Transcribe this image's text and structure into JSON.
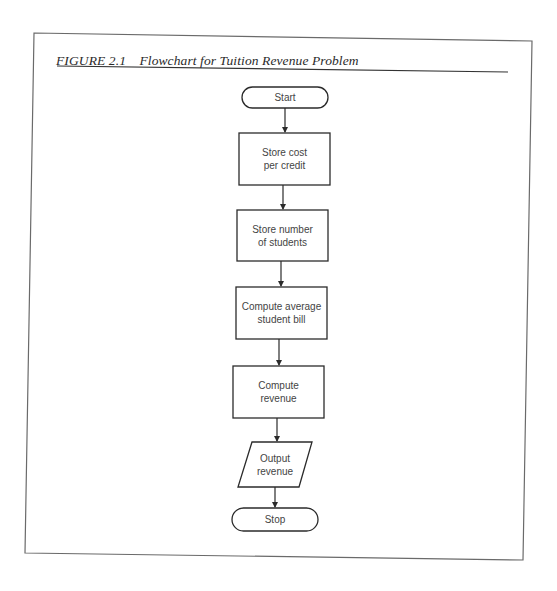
{
  "figure": {
    "number": "FIGURE 2.1",
    "title": "Flowchart for Tuition Revenue Problem"
  },
  "flowchart": {
    "nodes": [
      {
        "id": "start",
        "type": "terminator",
        "label": "Start"
      },
      {
        "id": "store-cost",
        "type": "process",
        "label": "Store cost\nper credit"
      },
      {
        "id": "store-students",
        "type": "process",
        "label": "Store number\nof students"
      },
      {
        "id": "compute-bill",
        "type": "process",
        "label": "Compute average\nstudent bill"
      },
      {
        "id": "compute-revenue",
        "type": "process",
        "label": "Compute\nrevenue"
      },
      {
        "id": "output-revenue",
        "type": "io",
        "label": "Output\nrevenue"
      },
      {
        "id": "stop",
        "type": "terminator",
        "label": "Stop"
      }
    ],
    "edges": [
      {
        "from": "start",
        "to": "store-cost"
      },
      {
        "from": "store-cost",
        "to": "store-students"
      },
      {
        "from": "store-students",
        "to": "compute-bill"
      },
      {
        "from": "compute-bill",
        "to": "compute-revenue"
      },
      {
        "from": "compute-revenue",
        "to": "output-revenue"
      },
      {
        "from": "output-revenue",
        "to": "stop"
      }
    ]
  },
  "colors": {
    "stroke": "#2b2b2b",
    "frame": "#555555",
    "text": "#444444"
  }
}
